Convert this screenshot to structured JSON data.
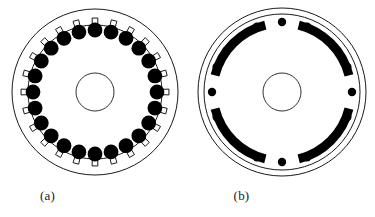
{
  "figure": {
    "kind": "technical-line-drawing",
    "background_color": "#ffffff",
    "stroke_color": "#1a1a1a",
    "fill_color": "#000000",
    "panels": [
      {
        "id": "a",
        "caption": "(a)",
        "name": "stator-cross-section",
        "center_x": 95,
        "center_y": 92,
        "outer_radius": 83,
        "inner_bore_radius": 67,
        "shaft_radius": 19,
        "slot_count": 24,
        "slot_opening_depth": 7,
        "slot_opening_width_deg": 4.5,
        "conductor_count": 24,
        "conductor_radius": 7.4,
        "conductor_ring_radius": 62,
        "conductor_start_angle_deg": -90,
        "rim_line_width": 1.0,
        "shaft_line_width": 0.9
      },
      {
        "id": "b",
        "caption": "(b)",
        "name": "rotor-cross-section",
        "center_x": 94,
        "center_y": 92,
        "outer_radius": 84,
        "inner_rim_radius": 78,
        "shaft_radius": 19,
        "rim_line_width": 1.0,
        "shaft_line_width": 0.9,
        "magnet_count": 4,
        "magnet_band_radius": 69,
        "magnet_thickness": 9,
        "magnet_span_deg": 62,
        "magnet_center_angles_deg": [
          -45,
          45,
          135,
          225
        ],
        "dot_count": 12,
        "dot_radius": 4.2,
        "dot_ring_radius": 70,
        "dot_group_count": 4,
        "dots_per_group": 3,
        "dot_group_center_angles_deg": [
          -90,
          0,
          90,
          180
        ],
        "dot_group_spread_deg": 21
      }
    ]
  }
}
